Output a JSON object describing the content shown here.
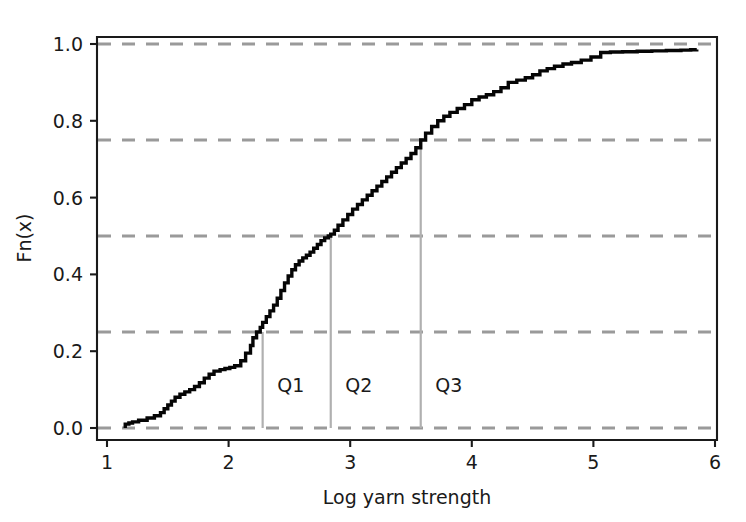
{
  "chart_data": {
    "type": "line",
    "title": "",
    "xlabel": "Log yarn strength",
    "ylabel": "Fn(x)",
    "xlim": [
      1,
      6
    ],
    "ylim": [
      -0.035,
      1.04
    ],
    "xticks": [
      1,
      2,
      3,
      4,
      5,
      6
    ],
    "xtick_labels": [
      "1",
      "2",
      "3",
      "4",
      "5",
      "6"
    ],
    "yticks": [
      0.0,
      0.2,
      0.4,
      0.6,
      0.8,
      1.0
    ],
    "ytick_labels": [
      "0.0",
      "0.2",
      "0.4",
      "0.6",
      "0.8",
      "1.0"
    ],
    "grid": true,
    "grid_style": "dashed",
    "grid_color": "#9a9a9a",
    "grid_levels": [
      0.0,
      0.25,
      0.5,
      0.75,
      1.0
    ],
    "legend": "none",
    "curve_color": "#050505",
    "series": [
      {
        "name": "Empirical CDF",
        "step": "post",
        "x": [
          1.15,
          1.18,
          1.21,
          1.26,
          1.33,
          1.39,
          1.44,
          1.47,
          1.5,
          1.53,
          1.56,
          1.6,
          1.64,
          1.68,
          1.72,
          1.76,
          1.8,
          1.84,
          1.88,
          1.93,
          1.97,
          2.01,
          2.05,
          2.1,
          2.14,
          2.18,
          2.2,
          2.23,
          2.26,
          2.28,
          2.31,
          2.34,
          2.37,
          2.4,
          2.43,
          2.46,
          2.49,
          2.52,
          2.55,
          2.58,
          2.61,
          2.64,
          2.67,
          2.7,
          2.73,
          2.76,
          2.79,
          2.82,
          2.84,
          2.87,
          2.9,
          2.94,
          2.98,
          3.02,
          3.06,
          3.1,
          3.14,
          3.18,
          3.22,
          3.26,
          3.3,
          3.34,
          3.38,
          3.42,
          3.46,
          3.5,
          3.54,
          3.58,
          3.62,
          3.67,
          3.72,
          3.77,
          3.82,
          3.88,
          3.94,
          4.0,
          4.06,
          4.12,
          4.18,
          4.24,
          4.3,
          4.37,
          4.44,
          4.5,
          4.56,
          4.62,
          4.68,
          4.75,
          4.82,
          4.9,
          4.98,
          5.06,
          5.14,
          5.24,
          5.36,
          5.48,
          5.6,
          5.72,
          5.8,
          5.85
        ],
        "y": [
          0.01,
          0.013,
          0.016,
          0.02,
          0.026,
          0.032,
          0.04,
          0.05,
          0.06,
          0.07,
          0.08,
          0.088,
          0.094,
          0.1,
          0.108,
          0.118,
          0.13,
          0.14,
          0.148,
          0.152,
          0.155,
          0.158,
          0.162,
          0.175,
          0.195,
          0.215,
          0.235,
          0.25,
          0.262,
          0.275,
          0.29,
          0.305,
          0.32,
          0.338,
          0.358,
          0.378,
          0.396,
          0.412,
          0.425,
          0.435,
          0.443,
          0.45,
          0.458,
          0.468,
          0.478,
          0.488,
          0.495,
          0.5,
          0.505,
          0.515,
          0.528,
          0.542,
          0.556,
          0.57,
          0.582,
          0.594,
          0.606,
          0.618,
          0.63,
          0.642,
          0.654,
          0.666,
          0.678,
          0.69,
          0.702,
          0.715,
          0.73,
          0.75,
          0.768,
          0.785,
          0.8,
          0.812,
          0.822,
          0.832,
          0.842,
          0.855,
          0.862,
          0.868,
          0.876,
          0.886,
          0.9,
          0.906,
          0.912,
          0.92,
          0.93,
          0.936,
          0.942,
          0.948,
          0.952,
          0.958,
          0.966,
          0.978,
          0.979,
          0.98,
          0.981,
          0.982,
          0.983,
          0.984,
          0.985,
          0.986
        ]
      }
    ],
    "annotations": [
      {
        "name": "Q1",
        "label": "Q1",
        "x": 2.28,
        "y": 0.25,
        "label_x": 2.4,
        "label_y": 0.095
      },
      {
        "name": "Q2",
        "label": "Q2",
        "x": 2.84,
        "y": 0.5,
        "label_x": 2.96,
        "label_y": 0.095
      },
      {
        "name": "Q3",
        "label": "Q3",
        "x": 3.58,
        "y": 0.75,
        "label_x": 3.7,
        "label_y": 0.095
      }
    ],
    "quartile_line_color": "#b0b0b0"
  }
}
